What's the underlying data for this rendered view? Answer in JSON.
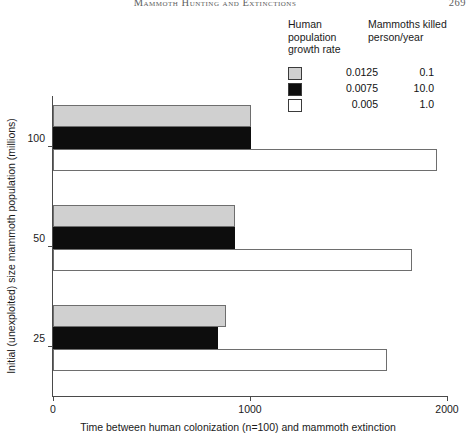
{
  "running_head": {
    "title": "Mammoth Hunting and Extinctions",
    "page_number": "269"
  },
  "legend": {
    "header_col1": "Human population growth rate",
    "header_col2": "Mammoths killed person/year",
    "rows": [
      {
        "swatch": "gray-swatch",
        "color": "#d0d0d0",
        "growth_rate": "0.0125",
        "killed": "0.1"
      },
      {
        "swatch": "black-swatch",
        "color": "#0d0d0d",
        "growth_rate": "0.0075",
        "killed": "10.0"
      },
      {
        "swatch": "white-swatch",
        "color": "#ffffff",
        "growth_rate": "0.005",
        "killed": "1.0"
      }
    ]
  },
  "chart_data": {
    "type": "bar",
    "orientation": "horizontal",
    "title": "",
    "xlabel": "Time between human colonization (n=100) and mammoth extinction",
    "ylabel": "Initial (unexploited) size mammoth population (millions)",
    "categories": [
      "100",
      "50",
      "25"
    ],
    "xlim": [
      0,
      2000
    ],
    "xticks": [
      0,
      1000,
      2000
    ],
    "xticklabels": [
      "0",
      "1000",
      "2000"
    ],
    "grid": false,
    "legend_position": "top-right",
    "series": [
      {
        "name": "0.0125",
        "killed_per_person_per_year": "0.1",
        "color": "#d0d0d0",
        "values": [
          1005,
          925,
          880
        ]
      },
      {
        "name": "0.0075",
        "killed_per_person_per_year": "10.0",
        "color": "#0d0d0d",
        "values": [
          1005,
          925,
          840
        ]
      },
      {
        "name": "0.005",
        "killed_per_person_per_year": "1.0",
        "color": "#ffffff",
        "values": [
          1950,
          1820,
          1695
        ]
      }
    ]
  }
}
